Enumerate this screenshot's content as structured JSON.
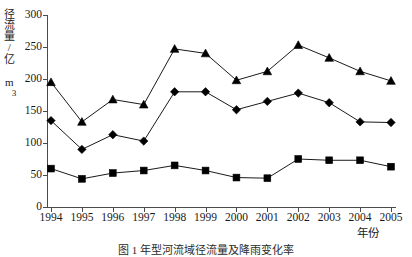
{
  "chart_data": {
    "type": "line",
    "title": "",
    "xlabel": "年份",
    "ylabel": "径流量/亿 m³",
    "categories": [
      "1994",
      "1995",
      "1996",
      "1997",
      "1998",
      "1999",
      "2000",
      "2001",
      "2002",
      "2003",
      "2004",
      "2005"
    ],
    "xlim": [
      1994,
      2005
    ],
    "ylim": [
      0,
      300
    ],
    "yticks": [
      0,
      50,
      100,
      150,
      200,
      250,
      300
    ],
    "ytick_labels": [
      "0",
      "50",
      "100",
      "150",
      "200",
      "250",
      "300"
    ],
    "grid": false,
    "legend": "none",
    "series": [
      {
        "name": "series-triangle",
        "marker": "triangle",
        "color": "#000000",
        "values": [
          195,
          133,
          168,
          160,
          247,
          240,
          198,
          212,
          253,
          233,
          212,
          197
        ]
      },
      {
        "name": "series-diamond",
        "marker": "diamond",
        "color": "#000000",
        "values": [
          135,
          90,
          113,
          103,
          180,
          180,
          152,
          165,
          178,
          163,
          133,
          132
        ]
      },
      {
        "name": "series-square",
        "marker": "square",
        "color": "#000000",
        "values": [
          60,
          44,
          53,
          57,
          65,
          57,
          46,
          45,
          75,
          73,
          73,
          63
        ]
      }
    ]
  },
  "axis": {
    "y_title": "径流量/亿 m",
    "y_title_exponent": "3",
    "x_title": "年份"
  },
  "caption": {
    "text": "图 1   年型河流域径流量及降雨变化率"
  }
}
